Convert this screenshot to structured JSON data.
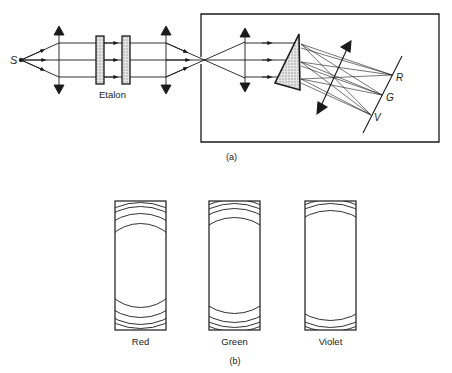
{
  "part_a": {
    "caption": "(a)",
    "source_label": "S",
    "etalon_label": "Etalon",
    "detector_labels": [
      "R",
      "G",
      "V"
    ]
  },
  "part_b": {
    "caption": "(b)",
    "panels": [
      {
        "label": "Red",
        "color_name": "red"
      },
      {
        "label": "Green",
        "color_name": "green"
      },
      {
        "label": "Violet",
        "color_name": "violet"
      }
    ]
  },
  "colors": {
    "line": "#1a1a1a",
    "hatch_fill": "#cfcfcf",
    "background": "#ffffff"
  }
}
